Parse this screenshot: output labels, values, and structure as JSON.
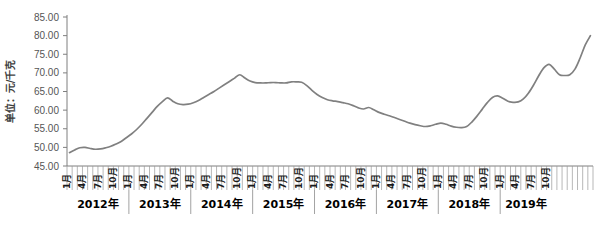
{
  "chart_data": {
    "type": "line",
    "title": "",
    "ylabel": "单位：元/千克",
    "xlabel": "",
    "ylim": [
      45.0,
      85.0
    ],
    "ytick_labels": [
      "45.00",
      "50.00",
      "55.00",
      "60.00",
      "65.00",
      "70.00",
      "75.00",
      "80.00",
      "85.00"
    ],
    "ytick_values": [
      45.0,
      50.0,
      55.0,
      60.0,
      65.0,
      70.0,
      75.0,
      80.0,
      85.0
    ],
    "grid": false,
    "legend": null,
    "line_color": "#808080",
    "axis_color": "#7f7f7f",
    "month_tick_labels": [
      "1月",
      "4月",
      "7月",
      "10月"
    ],
    "year_groups": [
      {
        "label": "2012年",
        "months": 12
      },
      {
        "label": "2013年",
        "months": 12
      },
      {
        "label": "2014年",
        "months": 12
      },
      {
        "label": "2015年",
        "months": 12
      },
      {
        "label": "2016年",
        "months": 12
      },
      {
        "label": "2017年",
        "months": 12
      },
      {
        "label": "2018年",
        "months": 12
      },
      {
        "label": "2019年",
        "months": 10
      }
    ],
    "x": [
      "2012-01",
      "2012-02",
      "2012-03",
      "2012-04",
      "2012-05",
      "2012-06",
      "2012-07",
      "2012-08",
      "2012-09",
      "2012-10",
      "2012-11",
      "2012-12",
      "2013-01",
      "2013-02",
      "2013-03",
      "2013-04",
      "2013-05",
      "2013-06",
      "2013-07",
      "2013-08",
      "2013-09",
      "2013-10",
      "2013-11",
      "2013-12",
      "2014-01",
      "2014-02",
      "2014-03",
      "2014-04",
      "2014-05",
      "2014-06",
      "2014-07",
      "2014-08",
      "2014-09",
      "2014-10",
      "2014-11",
      "2014-12",
      "2015-01",
      "2015-02",
      "2015-03",
      "2015-04",
      "2015-05",
      "2015-06",
      "2015-07",
      "2015-08",
      "2015-09",
      "2015-10",
      "2015-11",
      "2015-12",
      "2016-01",
      "2016-02",
      "2016-03",
      "2016-04",
      "2016-05",
      "2016-06",
      "2016-07",
      "2016-08",
      "2016-09",
      "2016-10",
      "2016-11",
      "2016-12",
      "2017-01",
      "2017-02",
      "2017-03",
      "2017-04",
      "2017-05",
      "2017-06",
      "2017-07",
      "2017-08",
      "2017-09",
      "2017-10",
      "2017-11",
      "2017-12",
      "2018-01",
      "2018-02",
      "2018-03",
      "2018-04",
      "2018-05",
      "2018-06",
      "2018-07",
      "2018-08",
      "2018-09",
      "2018-10",
      "2018-11",
      "2018-12",
      "2019-01",
      "2019-02",
      "2019-03",
      "2019-04",
      "2019-05",
      "2019-06",
      "2019-07",
      "2019-08",
      "2019-09",
      "2019-10"
    ],
    "values": [
      48.6,
      49.3,
      49.9,
      50.0,
      49.7,
      49.5,
      49.6,
      49.9,
      50.3,
      50.9,
      51.6,
      52.6,
      53.6,
      54.8,
      56.2,
      57.8,
      59.4,
      61.0,
      62.3,
      63.3,
      62.4,
      61.7,
      61.5,
      61.6,
      62.0,
      62.6,
      63.4,
      64.2,
      65.0,
      65.9,
      66.8,
      67.7,
      68.6,
      69.5,
      68.6,
      67.8,
      67.4,
      67.3,
      67.3,
      67.4,
      67.4,
      67.3,
      67.3,
      67.6,
      67.6,
      67.5,
      66.6,
      65.3,
      64.2,
      63.4,
      62.8,
      62.5,
      62.3,
      62.0,
      61.7,
      61.2,
      60.6,
      60.3,
      60.7,
      60.1,
      59.4,
      58.9,
      58.5,
      58.0,
      57.5,
      57.0,
      56.5,
      56.1,
      55.8,
      55.6,
      55.8,
      56.2,
      56.5,
      56.2,
      55.7,
      55.4,
      55.3,
      55.6,
      56.8,
      58.4,
      60.2,
      62.0,
      63.4,
      63.8,
      63.2,
      62.4,
      62.1,
      62.2,
      63.0,
      64.6,
      66.8,
      69.3,
      71.4,
      72.3
    ],
    "values_tail": [
      71.0,
      69.5,
      69.3,
      69.5,
      71.0,
      74.0,
      77.5,
      80.0
    ],
    "series_note": "monthly average price"
  }
}
